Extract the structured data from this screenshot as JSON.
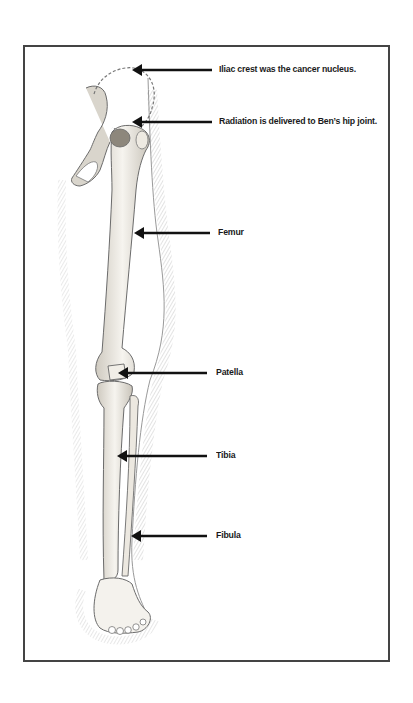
{
  "diagram": {
    "colors": {
      "frame": "#444444",
      "arrow": "#111111",
      "bone_fill": "#f3f1ec",
      "bone_stroke": "#6b6b6b",
      "shading": "#9a9a9a",
      "dashed_outline": "#777777"
    },
    "labels": [
      {
        "id": "iliac-crest",
        "text": "Iliac crest was the cancer nucleus.",
        "x": 219,
        "y": 67,
        "arrow_from": 212,
        "arrow_to": 132
      },
      {
        "id": "radiation-hip",
        "text": "Radiation is delivered to Ben’s hip joint.",
        "x": 219,
        "y": 117,
        "arrow_from": 212,
        "arrow_to": 132
      },
      {
        "id": "femur",
        "text": "Femur",
        "x": 219,
        "y": 227,
        "arrow_from": 212,
        "arrow_to": 134
      },
      {
        "id": "patella",
        "text": "Patella",
        "x": 217,
        "y": 367,
        "arrow_from": 208,
        "arrow_to": 118
      },
      {
        "id": "tibia",
        "text": "Tibia",
        "x": 217,
        "y": 450,
        "arrow_from": 207,
        "arrow_to": 117
      },
      {
        "id": "fibula",
        "text": "Fibula",
        "x": 217,
        "y": 530,
        "arrow_from": 207,
        "arrow_to": 131
      }
    ]
  }
}
